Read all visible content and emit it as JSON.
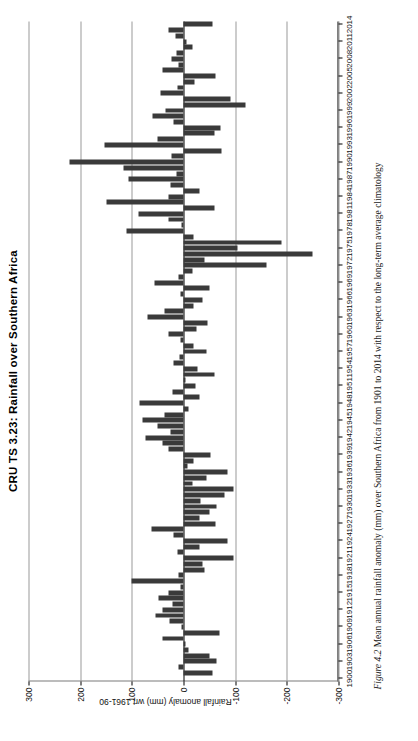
{
  "figure": {
    "title": "CRU TS 3.23: Rainfall over Southern Africa",
    "caption_prefix": "Figure 4.2",
    "caption_text": "Mean annual rainfall anomaly (mm) over Southern Africa from 1901 to 2014 with respect to the long-term average climatology"
  },
  "axes": {
    "value_axis_label": "Rainfall anomaly (mm) wrt 1961-90",
    "value_ticks": [
      "300",
      "200",
      "100",
      "0",
      "-100",
      "-200",
      "-300"
    ],
    "value_tick_numbers": [
      300,
      200,
      100,
      0,
      -100,
      -200,
      -300
    ],
    "year_ticks": [
      "1900",
      "1903",
      "1906",
      "1909",
      "1912",
      "1915",
      "1918",
      "1921",
      "1924",
      "1927",
      "1930",
      "1933",
      "1936",
      "1939",
      "1942",
      "1945",
      "1948",
      "1951",
      "1954",
      "1957",
      "1960",
      "1963",
      "1966",
      "1969",
      "1972",
      "1975",
      "1978",
      "1981",
      "1984",
      "1987",
      "1990",
      "1993",
      "1996",
      "1999",
      "2002",
      "2005",
      "2008",
      "2011",
      "2014"
    ],
    "ylim": [
      -300,
      300
    ],
    "xlim": [
      1899.5,
      2014.5
    ],
    "grid": true,
    "bar_color": "#3a3a3a"
  },
  "chart_data": {
    "type": "bar",
    "title": "CRU TS 3.23: Rainfall over Southern Africa",
    "xlabel": "",
    "ylabel": "Rainfall anomaly (mm) wrt 1961-90",
    "ylim": [
      -300,
      300
    ],
    "grid": true,
    "orientation": "vertical-bars-rotated-90",
    "legend": null,
    "categories": [
      1901,
      1902,
      1903,
      1904,
      1905,
      1906,
      1907,
      1908,
      1909,
      1910,
      1911,
      1912,
      1913,
      1914,
      1915,
      1916,
      1917,
      1918,
      1919,
      1920,
      1921,
      1922,
      1923,
      1924,
      1925,
      1926,
      1927,
      1928,
      1929,
      1930,
      1931,
      1932,
      1933,
      1934,
      1935,
      1936,
      1937,
      1938,
      1939,
      1940,
      1941,
      1942,
      1943,
      1944,
      1945,
      1946,
      1947,
      1948,
      1949,
      1950,
      1951,
      1952,
      1953,
      1954,
      1955,
      1956,
      1957,
      1958,
      1959,
      1960,
      1961,
      1962,
      1963,
      1964,
      1965,
      1966,
      1967,
      1968,
      1969,
      1970,
      1971,
      1972,
      1973,
      1974,
      1975,
      1976,
      1977,
      1978,
      1979,
      1980,
      1981,
      1982,
      1983,
      1984,
      1985,
      1986,
      1987,
      1988,
      1989,
      1990,
      1991,
      1992,
      1993,
      1994,
      1995,
      1996,
      1997,
      1998,
      1999,
      2000,
      2001,
      2002,
      2003,
      2004,
      2005,
      2006,
      2007,
      2008,
      2009,
      2010,
      2011,
      2012,
      2013,
      2014
    ],
    "values": [
      -56,
      10,
      -64,
      -50,
      -10,
      -4,
      40,
      -70,
      4,
      28,
      55,
      40,
      22,
      48,
      30,
      6,
      100,
      10,
      -40,
      -36,
      -96,
      12,
      -30,
      -86,
      20,
      62,
      -62,
      -30,
      -50,
      -64,
      -32,
      -80,
      -96,
      -18,
      -44,
      -86,
      -8,
      -20,
      -52,
      30,
      40,
      74,
      26,
      50,
      80,
      36,
      -10,
      86,
      -30,
      22,
      -24,
      -4,
      -60,
      -28,
      20,
      8,
      -44,
      -20,
      6,
      30,
      -26,
      -46,
      70,
      36,
      -20,
      -36,
      6,
      -50,
      56,
      10,
      -18,
      -160,
      -40,
      -250,
      -104,
      -190,
      -20,
      110,
      4,
      30,
      88,
      -60,
      150,
      30,
      -30,
      26,
      106,
      14,
      116,
      220,
      24,
      -74,
      152,
      50,
      -60,
      -72,
      20,
      60,
      34,
      -120,
      -90,
      44,
      12,
      -22,
      -62,
      40,
      10,
      24,
      14,
      -18,
      -6,
      16,
      30,
      -56
    ],
    "value_ticks": [
      300,
      200,
      100,
      0,
      -100,
      -200,
      -300
    ],
    "year_ticks": [
      1900,
      1903,
      1906,
      1909,
      1912,
      1915,
      1918,
      1921,
      1924,
      1927,
      1930,
      1933,
      1936,
      1939,
      1942,
      1945,
      1948,
      1951,
      1954,
      1957,
      1960,
      1963,
      1966,
      1969,
      1972,
      1975,
      1978,
      1981,
      1984,
      1987,
      1990,
      1993,
      1996,
      1999,
      2002,
      2005,
      2008,
      2011,
      2014
    ],
    "series": [
      {
        "name": "Rainfall anomaly (mm)",
        "color": "#3a3a3a"
      }
    ]
  }
}
